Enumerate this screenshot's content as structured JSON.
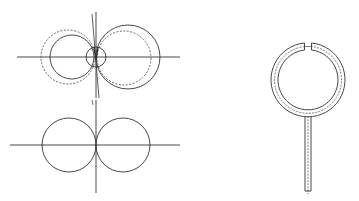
{
  "figure": {
    "width": 359,
    "height": 201,
    "background": "#ffffff",
    "stroke_color": "#333333",
    "dashed_color": "#555555",
    "panels": [
      {
        "id": "dipole-with-offset",
        "description": "Two-lobe radiation pattern with dashed shifted pattern, small central loop and tilted axis"
      },
      {
        "id": "dipole-pattern",
        "description": "Figure-eight (two tangent circles) pattern on crossed axes"
      },
      {
        "id": "loop-antenna",
        "description": "Shielded loop antenna with gap at top and coaxial feed stem"
      }
    ]
  }
}
